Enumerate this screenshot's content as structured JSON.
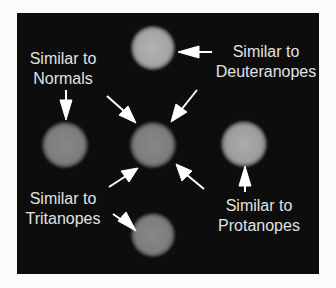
{
  "figure": {
    "background_color": "#0d0d0d",
    "text_color": "#e2e2e2",
    "arrow_color": "#ffffff",
    "circles": [
      {
        "id": "top",
        "cx": 153,
        "cy": 48,
        "r": 22,
        "fill": "#a8a8a8",
        "role": "deuteranopes-match"
      },
      {
        "id": "left",
        "cx": 65,
        "cy": 145,
        "r": 23,
        "fill": "#7a7a7a",
        "role": "normals-match"
      },
      {
        "id": "center",
        "cx": 153,
        "cy": 145,
        "r": 23,
        "fill": "#808080",
        "role": "reference"
      },
      {
        "id": "right",
        "cx": 244,
        "cy": 144,
        "r": 23,
        "fill": "#a0a0a0",
        "role": "protanopes-match"
      },
      {
        "id": "bottom",
        "cx": 153,
        "cy": 235,
        "r": 22,
        "fill": "#7c7c7c",
        "role": "tritanopes-match"
      }
    ],
    "labels": {
      "normals": {
        "line1": "Similar to",
        "line2": "Normals"
      },
      "deuteranopes": {
        "line1": "Similar to",
        "line2": "Deuteranopes"
      },
      "protanopes": {
        "line1": "Similar to",
        "line2": "Protanopes"
      },
      "tritanopes": {
        "line1": "Similar to",
        "line2": "Tritanopes"
      }
    }
  }
}
